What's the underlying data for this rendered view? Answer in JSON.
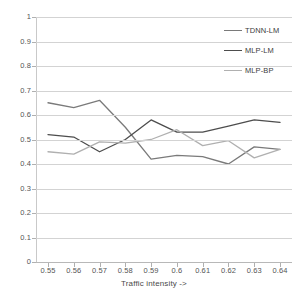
{
  "chart_data": {
    "type": "line",
    "title": "",
    "xlabel": "Traffic intensity ->",
    "ylabel": "",
    "x": [
      0.55,
      0.56,
      0.57,
      0.58,
      0.59,
      0.6,
      0.61,
      0.62,
      0.63,
      0.64
    ],
    "categories": [
      "0.55",
      "0.56",
      "0.57",
      "0.58",
      "0.59",
      "0.6",
      "0.61",
      "0.62",
      "0.63",
      "0.64"
    ],
    "xlim": [
      0.55,
      0.64
    ],
    "ylim": [
      0,
      1
    ],
    "yticks": [
      0,
      0.1,
      0.2,
      0.3,
      0.4,
      0.5,
      0.6,
      0.7,
      0.8,
      0.9,
      1
    ],
    "ytick_labels": [
      "0",
      "0.1",
      "0.2",
      "0.3",
      "0.4",
      "0.5",
      "0.6",
      "0.7",
      "0.8",
      "0.9",
      "1"
    ],
    "grid": true,
    "grid_color": "#d3d3d3",
    "legend_position": "top-right",
    "series": [
      {
        "name": "TDNN-LM",
        "color": "#7a7a7a",
        "values": [
          0.65,
          0.63,
          0.66,
          0.55,
          0.42,
          0.435,
          0.43,
          0.4,
          0.47,
          0.46
        ]
      },
      {
        "name": "MLP-LM",
        "color": "#4d4d4d",
        "values": [
          0.52,
          0.51,
          0.45,
          0.5,
          0.58,
          0.53,
          0.53,
          0.555,
          0.58,
          0.57
        ]
      },
      {
        "name": "MLP-BP",
        "color": "#b0b0b0",
        "values": [
          0.45,
          0.44,
          0.49,
          0.485,
          0.5,
          0.54,
          0.475,
          0.495,
          0.425,
          0.46
        ]
      }
    ]
  },
  "legend": {
    "items": [
      {
        "label": "TDNN-LM",
        "color": "#7a7a7a"
      },
      {
        "label": "MLP-LM",
        "color": "#4d4d4d"
      },
      {
        "label": "MLP-BP",
        "color": "#b0b0b0"
      }
    ]
  },
  "axis": {
    "x_title": "Traffic intensity ->"
  }
}
